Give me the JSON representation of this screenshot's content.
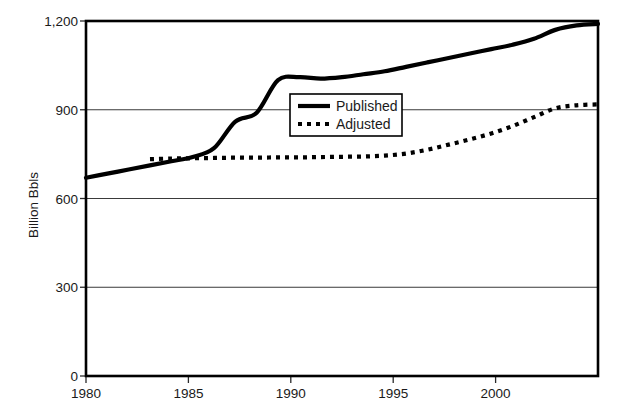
{
  "chart_data": {
    "type": "line",
    "title": "",
    "subtitle": "",
    "xlabel": "",
    "ylabel": "Billion Bbls",
    "xlim": [
      1980,
      2004
    ],
    "ylim": [
      0,
      1200
    ],
    "grid": true,
    "grid_axis": "y",
    "legend_position": "inside-upper-center",
    "x_tick_labels": [
      "1980",
      "1985",
      "1990",
      "1995",
      "2000"
    ],
    "x_tick_values": [
      1980,
      1985,
      1990,
      1995,
      2000
    ],
    "y_tick_labels": [
      "0",
      "300",
      "600",
      "900",
      "1,200"
    ],
    "y_tick_values": [
      0,
      300,
      600,
      900,
      1200
    ],
    "x": [
      1980,
      1981,
      1982,
      1983,
      1984,
      1985,
      1986,
      1987,
      1988,
      1989,
      1990,
      1991,
      1992,
      1993,
      1994,
      1995,
      1996,
      1997,
      1998,
      1999,
      2000,
      2001,
      2002,
      2003,
      2004
    ],
    "series": [
      {
        "name": "Published",
        "style": "solid",
        "values": [
          670,
          684,
          698,
          712,
          726,
          740,
          770,
          860,
          890,
          1000,
          1010,
          1005,
          1010,
          1020,
          1030,
          1045,
          1060,
          1075,
          1090,
          1105,
          1120,
          1140,
          1170,
          1185,
          1190
        ]
      },
      {
        "name": "Adjusted",
        "style": "dotted",
        "start_year": 1983,
        "values": [
          null,
          null,
          null,
          733,
          735,
          736,
          737,
          738,
          738,
          739,
          739,
          740,
          741,
          742,
          745,
          752,
          765,
          782,
          800,
          820,
          845,
          875,
          905,
          915,
          918
        ]
      }
    ],
    "legend": [
      {
        "label": "Published",
        "style": "solid"
      },
      {
        "label": "Adjusted",
        "style": "dotted"
      }
    ]
  }
}
